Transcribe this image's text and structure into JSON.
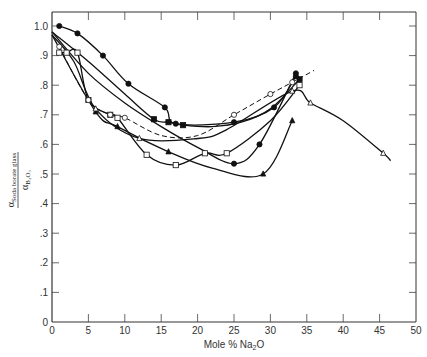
{
  "chart_data": {
    "type": "line",
    "title": "",
    "xlabel": "Mole % Na2O",
    "ylabel": "α Soda borate glass / α B2O3",
    "xlim": [
      0,
      50
    ],
    "ylim": [
      0,
      1.05
    ],
    "grid": false,
    "legend": "none",
    "x_ticks": [
      "0",
      "5",
      "10",
      "15",
      "20",
      "25",
      "30",
      "35",
      "40",
      "45",
      "50"
    ],
    "y_ticks": [
      "0",
      ".1",
      ".2",
      ".3",
      ".4",
      ".5",
      ".6",
      ".7",
      ".8",
      ".9",
      "1.0"
    ],
    "series": [
      {
        "name": "filled-circles-upper",
        "marker": "filled-circle",
        "style": "solid",
        "x": [
          1,
          3.5,
          7,
          10.5,
          15.5,
          17,
          25,
          30.5,
          33.5
        ],
        "y": [
          1.0,
          0.975,
          0.9,
          0.805,
          0.725,
          0.67,
          0.675,
          0.725,
          0.83
        ]
      },
      {
        "name": "filled-squares",
        "marker": "filled-square",
        "style": "solid",
        "x": [
          0,
          5,
          10,
          14,
          16,
          18,
          22,
          26,
          30,
          34
        ],
        "y": [
          0.98,
          0.88,
          0.77,
          0.685,
          0.675,
          0.665,
          0.66,
          0.675,
          0.72,
          0.82
        ]
      },
      {
        "name": "filled-triangles",
        "marker": "filled-triangle",
        "style": "solid",
        "x": [
          0,
          6,
          9,
          16,
          22,
          29,
          33
        ],
        "y": [
          0.97,
          0.71,
          0.66,
          0.575,
          0.52,
          0.5,
          0.68
        ]
      },
      {
        "name": "filled-circles-lower",
        "marker": "filled-circle",
        "style": "solid",
        "x": [
          0,
          5,
          10,
          15,
          20,
          25,
          28.5,
          33.5
        ],
        "y": [
          0.98,
          0.84,
          0.74,
          0.66,
          0.59,
          0.535,
          0.6,
          0.84
        ]
      },
      {
        "name": "open-squares",
        "marker": "open-square",
        "style": "solid",
        "x": [
          1,
          2,
          3.5,
          5,
          8,
          9,
          13,
          17,
          21,
          24,
          30,
          34
        ],
        "y": [
          0.91,
          0.91,
          0.91,
          0.75,
          0.7,
          0.69,
          0.565,
          0.53,
          0.57,
          0.57,
          0.68,
          0.8
        ]
      },
      {
        "name": "open-circles-dashed",
        "marker": "open-circle",
        "style": "dashed",
        "x": [
          1,
          5,
          8,
          10,
          15,
          20,
          25,
          30,
          33,
          36
        ],
        "y": [
          0.93,
          0.75,
          0.7,
          0.69,
          0.63,
          0.63,
          0.7,
          0.77,
          0.81,
          0.85
        ]
      },
      {
        "name": "open-triangles",
        "marker": "open-triangle",
        "style": "solid",
        "x": [
          0,
          3,
          6,
          12,
          20,
          24,
          33,
          35.5,
          40,
          45.5,
          46.5
        ],
        "y": [
          0.97,
          0.88,
          0.72,
          0.62,
          0.62,
          0.65,
          0.78,
          0.74,
          0.68,
          0.57,
          0.545
        ]
      }
    ]
  }
}
